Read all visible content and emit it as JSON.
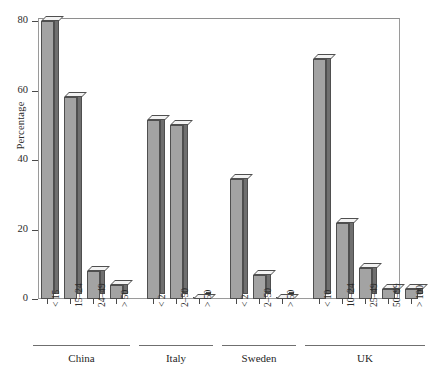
{
  "chart_data": {
    "type": "bar",
    "title": "",
    "xlabel": "",
    "ylabel": "Percentage",
    "ylim": [
      0,
      80
    ],
    "yticks": [
      0,
      20,
      40,
      60,
      80
    ],
    "grid": false,
    "legend": null,
    "style": "3d-bars-grayscale",
    "groups": [
      {
        "name": "China",
        "categories": [
          "< 15",
          "15–24",
          "24–49",
          "> 50"
        ],
        "values": [
          80,
          58,
          8,
          4
        ]
      },
      {
        "name": "Italy",
        "categories": [
          "< 2",
          "2–50",
          "> 50"
        ],
        "values": [
          51.5,
          50,
          0
        ]
      },
      {
        "name": "Sweden",
        "categories": [
          "< 2",
          "2–50",
          "> 50"
        ],
        "values": [
          34.5,
          7,
          0
        ]
      },
      {
        "name": "UK",
        "categories": [
          "< 10",
          "10–24",
          "25–49",
          "50–99",
          "> 100"
        ],
        "values": [
          69,
          22,
          9,
          3,
          3
        ]
      }
    ],
    "categories": [
      "< 15",
      "15–24",
      "24–49",
      "> 50",
      "< 2",
      "2–50",
      "> 50",
      "< 2",
      "2–50",
      "> 50",
      "< 10",
      "10–24",
      "25–49",
      "50–99",
      "> 100"
    ],
    "values": [
      80,
      58,
      8,
      4,
      51.5,
      50,
      0,
      34.5,
      7,
      0,
      69,
      22,
      9,
      3,
      3
    ],
    "colors": {
      "bar_front": "#a3a3a3",
      "bar_side": "#6f6f6f",
      "bar_top": "#f2f2f2",
      "outline": "#4f4f4f",
      "frame": "#9a9a9a",
      "text": "#1f1f1f",
      "background": "#ffffff"
    }
  }
}
